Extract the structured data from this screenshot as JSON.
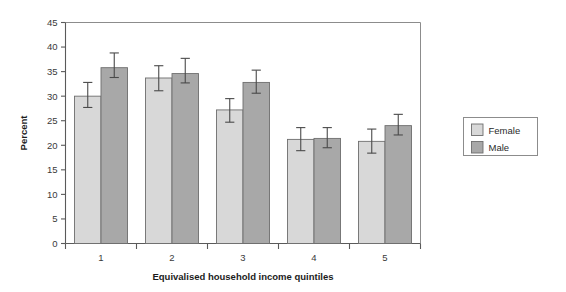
{
  "chart_data": {
    "type": "bar",
    "title": "",
    "subtitle": "",
    "xlabel": "Equivalised household income quintiles",
    "ylabel": "Percent",
    "categories": [
      "1",
      "2",
      "3",
      "4",
      "5"
    ],
    "ylim": [
      0,
      45
    ],
    "yticks": [
      0,
      5,
      10,
      15,
      20,
      25,
      30,
      35,
      40,
      45
    ],
    "ytick_labels": [
      "0",
      "5",
      "10",
      "15",
      "20",
      "25",
      "30",
      "35",
      "40",
      "45"
    ],
    "grid": false,
    "legend_position": "right-outside",
    "series": [
      {
        "name": "Female",
        "color": "#d8d8d8",
        "values": [
          30.0,
          33.7,
          27.2,
          21.2,
          20.8
        ],
        "errors_low": [
          27.7,
          31.1,
          24.7,
          18.9,
          18.4
        ],
        "errors_high": [
          32.8,
          36.2,
          29.5,
          23.6,
          23.3
        ]
      },
      {
        "name": "Male",
        "color": "#a8a8a8",
        "values": [
          35.8,
          34.6,
          32.8,
          21.4,
          24.0
        ],
        "errors_low": [
          33.8,
          32.7,
          30.6,
          19.5,
          22.1
        ],
        "errors_high": [
          38.8,
          37.7,
          35.3,
          23.6,
          26.3
        ]
      }
    ]
  },
  "legend": {
    "items": [
      {
        "label": "Female",
        "color": "#d8d8d8"
      },
      {
        "label": "Male",
        "color": "#a8a8a8"
      }
    ]
  }
}
